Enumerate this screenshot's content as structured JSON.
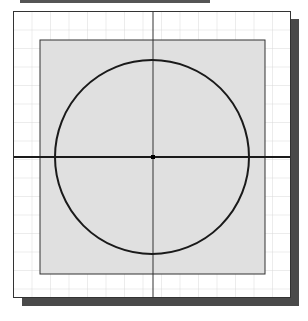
{
  "diagram": {
    "colors": {
      "grid": "#d9d9d9",
      "rect_fill": "#e0e0e0",
      "stroke": "#1a1a1a",
      "shadow": "#4a4a4a",
      "background": "#ffffff"
    },
    "grid_spacing_px": 18.5,
    "rectangle": {
      "x": 40,
      "y": 40,
      "width": 225,
      "height": 234
    },
    "circle": {
      "cx": 152,
      "cy": 157,
      "r": 97
    },
    "axes": {
      "horizontal_y": 157,
      "vertical_x": 153
    }
  }
}
